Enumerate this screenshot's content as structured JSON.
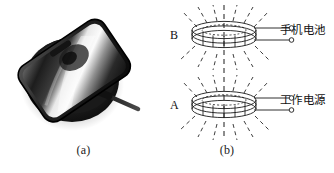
{
  "figure": {
    "background": "#ffffff",
    "ink": "#1a1a1a"
  },
  "panel_a": {
    "caption": "(a)",
    "photo": {
      "name": "phone-on-wireless-charging-pad",
      "description": "Smartphone resting on a round black wireless charging pad with a cable",
      "phone_body_color": "#2b2b2b",
      "pad_color": "#1b1b1b",
      "screen_highlight_color": "#f2f2f2",
      "cable_color": "#2a2a2a"
    }
  },
  "panel_b": {
    "caption": "(b)",
    "axis": {
      "name": "center-dashed-axis",
      "style": "dashed-vertical"
    },
    "coils": [
      {
        "letter": "B",
        "role": "receiver",
        "terminal_label": "手机电池",
        "turns": 3,
        "position": "top"
      },
      {
        "letter": "A",
        "role": "transmitter",
        "terminal_label": "工作电源",
        "turns": 3,
        "position": "bottom"
      }
    ],
    "field_lines": {
      "name": "magnetic-field-lines",
      "style": "dashed",
      "count_per_coil": 12
    },
    "terminals": {
      "name": "open-circle-terminal",
      "count": 4
    }
  }
}
